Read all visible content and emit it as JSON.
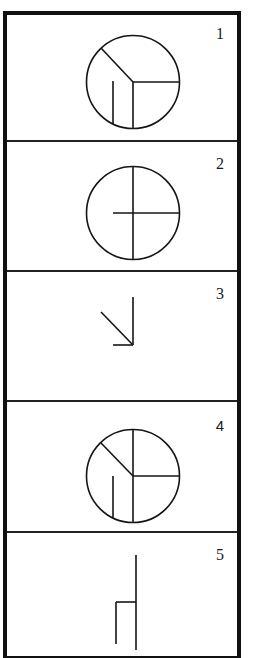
{
  "diagram": {
    "type": "sequence-panels",
    "panel_count": 5,
    "colors": {
      "frame": "#111111",
      "stroke": "#151515",
      "background": "#ffffff"
    },
    "panels": [
      {
        "label": "1",
        "figure": "circle-with-y-divisions-and-inner-stroke",
        "description": "Circle with radius from upper-left to center, radius to right, radius down to bottom, plus a short vertical stroke in lower-left sector"
      },
      {
        "label": "2",
        "figure": "circle-with-vertical-diameter-and-partial-horizontal",
        "description": "Circle with full vertical diameter and a horizontal line from left of center to the right edge"
      },
      {
        "label": "3",
        "figure": "arrow-down-right",
        "description": "Diagonal line pointing down-right meeting a vertical line and a short horizontal line at a corner"
      },
      {
        "label": "4",
        "figure": "circle-with-full-vertical-diagonal-horizontal-and-inner-stroke",
        "description": "Circle with full vertical diameter, radius from upper-left to center, radius to right, plus short vertical stroke in lower-left sector"
      },
      {
        "label": "5",
        "figure": "open-lines-no-circle",
        "description": "Long vertical line with a short horizontal branch to the left that descends into a shorter vertical line"
      }
    ]
  }
}
